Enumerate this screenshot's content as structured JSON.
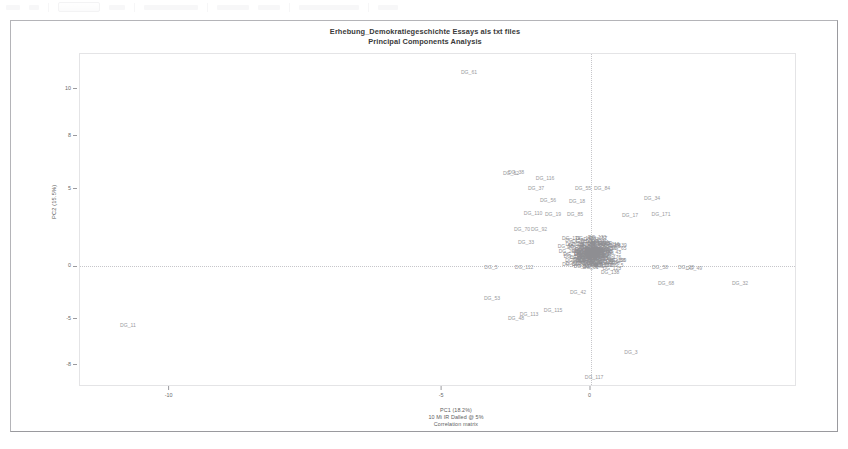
{
  "toolbar": {
    "present": true,
    "note": "faint washed-out application toolbar strip"
  },
  "window": {
    "title_lines": [
      "Erhebung_Demokratiegeschichte Essays als txt files",
      "Principal Components Analysis"
    ]
  },
  "axes": {
    "ylabel": "PC2 (15.5%)",
    "xlabel_lines": [
      "PC1 (18.2%)",
      "10 Mi IR  Dalled @ 5%",
      "Correlation matrix"
    ],
    "yticks": [
      {
        "label": "10",
        "pos": 0.105
      },
      {
        "label": "8",
        "pos": 0.245
      },
      {
        "label": "5",
        "pos": 0.405
      },
      {
        "label": "0",
        "pos": 0.638
      },
      {
        "label": "-5",
        "pos": 0.795
      },
      {
        "label": "-8",
        "pos": 0.935
      }
    ],
    "xticks": [
      {
        "label": "-10",
        "pos": 0.125
      },
      {
        "label": "-5",
        "pos": 0.505
      },
      {
        "label": "0",
        "pos": 0.712
      }
    ],
    "gridlines": {
      "horizontal": [
        0.638
      ],
      "vertical": [
        0.712
      ]
    }
  },
  "chart_data": {
    "type": "scatter",
    "title": "Erhebung_Demokratiegeschichte Essays als txt files",
    "subtitle": "Principal Components Analysis",
    "xlabel": "PC1 (18.2%)",
    "ylabel": "PC2 (15.5%)",
    "footnote": "Correlation matrix",
    "grid": true,
    "legend": "none",
    "xlim": [
      -13,
      5
    ],
    "ylim": [
      -9,
      11
    ],
    "point_label_prefix": "DG_",
    "outliers": [
      {
        "label": "DG_61",
        "x": 467,
        "y": 70
      },
      {
        "label": "DG_11",
        "x": 126,
        "y": 323
      },
      {
        "label": "DG_3",
        "x": 629,
        "y": 350
      },
      {
        "label": "DG_117",
        "x": 592,
        "y": 375
      },
      {
        "label": "DG_32",
        "x": 738,
        "y": 281
      },
      {
        "label": "DG_53",
        "x": 490,
        "y": 296
      },
      {
        "label": "DG_5",
        "x": 489,
        "y": 265
      },
      {
        "label": "DG_112",
        "x": 522,
        "y": 265
      },
      {
        "label": "DG_48",
        "x": 514,
        "y": 316
      },
      {
        "label": "DG_113",
        "x": 527,
        "y": 312
      },
      {
        "label": "DG_115",
        "x": 551,
        "y": 308
      },
      {
        "label": "DG_42",
        "x": 576,
        "y": 290
      },
      {
        "label": "DG_58",
        "x": 658,
        "y": 265
      },
      {
        "label": "DG_68",
        "x": 664,
        "y": 281
      },
      {
        "label": "DG_49",
        "x": 692,
        "y": 266
      },
      {
        "label": "DG_28",
        "x": 684,
        "y": 265
      },
      {
        "label": "DG_52",
        "x": 509,
        "y": 171
      },
      {
        "label": "DG_38",
        "x": 514,
        "y": 170
      },
      {
        "label": "DG_116",
        "x": 543,
        "y": 176
      },
      {
        "label": "DG_37",
        "x": 534,
        "y": 186
      },
      {
        "label": "DG_84",
        "x": 600,
        "y": 186
      },
      {
        "label": "DG_55",
        "x": 581,
        "y": 186
      },
      {
        "label": "DG_56",
        "x": 546,
        "y": 198
      },
      {
        "label": "DG_18",
        "x": 575,
        "y": 199
      },
      {
        "label": "DG_34",
        "x": 650,
        "y": 196
      },
      {
        "label": "DG_171",
        "x": 659,
        "y": 212
      },
      {
        "label": "DG_17",
        "x": 628,
        "y": 213
      },
      {
        "label": "DG_110",
        "x": 531,
        "y": 211
      },
      {
        "label": "DG_19",
        "x": 551,
        "y": 212
      },
      {
        "label": "DG_85",
        "x": 573,
        "y": 212
      },
      {
        "label": "DG_70",
        "x": 520,
        "y": 227
      },
      {
        "label": "DG_92",
        "x": 537,
        "y": 227
      },
      {
        "label": "DG_33",
        "x": 524,
        "y": 240
      }
    ],
    "cluster": {
      "center_x": 592,
      "center_y": 252,
      "spread_x": 46,
      "spread_y": 28,
      "count": 150,
      "description": "dense overplotted cloud of DG_ labels"
    }
  }
}
